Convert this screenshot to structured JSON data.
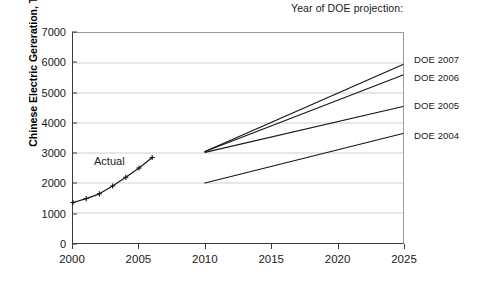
{
  "annotation": {
    "projection_note": "Year of DOE projection:",
    "actual_label": "Actual"
  },
  "chart_data": {
    "type": "line",
    "title": "",
    "xlabel": "",
    "ylabel": "Chinese Electric Gereration, TWH",
    "xlim": [
      2000,
      2025
    ],
    "ylim": [
      0,
      7000
    ],
    "xticks": [
      2000,
      2005,
      2010,
      2015,
      2020,
      2025
    ],
    "yticks": [
      0,
      1000,
      2000,
      3000,
      4000,
      5000,
      6000,
      7000
    ],
    "grid": "horizontal",
    "legend_position": "inline-right-of-lines",
    "series": [
      {
        "name": "Actual",
        "marker": "plus",
        "label": "Actual",
        "label_x": 2002.1,
        "label_y": 2350,
        "x": [
          2000,
          2001,
          2002,
          2003,
          2004,
          2005,
          2006
        ],
        "y": [
          1350,
          1480,
          1640,
          1900,
          2190,
          2500,
          2850
        ]
      },
      {
        "name": "DOE 2007",
        "label": "DOE 2007",
        "x": [
          2010,
          2025
        ],
        "y": [
          3050,
          5950
        ]
      },
      {
        "name": "DOE 2006",
        "label": "DOE 2006",
        "x": [
          2010,
          2025
        ],
        "y": [
          3050,
          5600
        ]
      },
      {
        "name": "DOE 2005",
        "label": "DOE 2005",
        "x": [
          2010,
          2025
        ],
        "y": [
          3020,
          4550
        ]
      },
      {
        "name": "DOE 2004",
        "label": "DOE 2004",
        "x": [
          2010,
          2025
        ],
        "y": [
          2000,
          3650
        ]
      }
    ]
  },
  "ytick_labels": [
    "7000",
    "6000",
    "5000",
    "4000",
    "3000",
    "2000",
    "1000",
    "0"
  ],
  "xtick_labels": [
    "2000",
    "2005",
    "2010",
    "2015",
    "2020",
    "2025"
  ],
  "series_labels": [
    {
      "text": "DOE 2007",
      "top": 54,
      "left": 414
    },
    {
      "text": "DOE 2006",
      "top": 72,
      "left": 414
    },
    {
      "text": "DOE 2005",
      "top": 100,
      "left": 414
    },
    {
      "text": "DOE 2004",
      "top": 130,
      "left": 414
    }
  ]
}
